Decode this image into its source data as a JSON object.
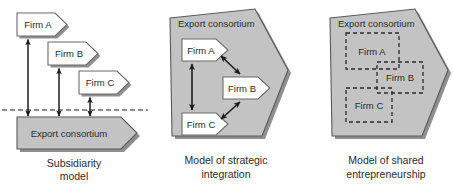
{
  "figure": {
    "panels": [
      {
        "id": "panel-subsidiarity",
        "caption_line1": "Subsidiarity",
        "caption_line2": "model",
        "consortium_label": "Export consortium",
        "firms": [
          {
            "label": "Firm A"
          },
          {
            "label": "Firm B"
          },
          {
            "label": "Firm C"
          }
        ],
        "relation": "vertical double-headed arrows across dashed boundary"
      },
      {
        "id": "panel-strategic-integration",
        "caption_line1": "Model of strategic",
        "caption_line2": "integration",
        "consortium_label": "Export consortium",
        "firms": [
          {
            "label": "Firm A"
          },
          {
            "label": "Firm B"
          },
          {
            "label": "Firm C"
          }
        ],
        "relation": "double-headed arrows between firms inside consortium"
      },
      {
        "id": "panel-shared-entrepreneurship",
        "caption_line1": "Model of shared",
        "caption_line2": "entrepreneurship",
        "consortium_label": "Export consortium",
        "firms": [
          {
            "label": "Firm A"
          },
          {
            "label": "Firm B"
          },
          {
            "label": "Firm C"
          }
        ],
        "relation": "overlapping dashed regions inside consortium"
      }
    ]
  },
  "colors": {
    "consortium_fill": "#c3c3c3",
    "consortium_stroke": "#5a5a5a",
    "firm_fill": "#ffffff",
    "firm_stroke": "#6b6b6b",
    "shadow": "#8f8f8f",
    "arrow": "#1d1d1d",
    "text": "#2b2b2b",
    "background": "#ffffff"
  }
}
